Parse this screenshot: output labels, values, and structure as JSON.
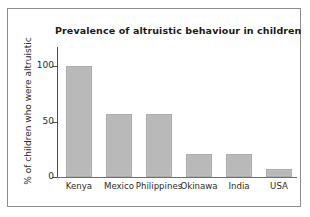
{
  "figure": {
    "title": "Prevalence of altruistic behaviour in children",
    "frame_color": "#8d8d8d",
    "background": "#ffffff",
    "bar_color": "#b9b9b9",
    "axis_color": "#4d4d4d"
  },
  "chart_data": {
    "type": "bar",
    "title": "Prevalence of altruistic behaviour in children",
    "xlabel": "",
    "ylabel": "% of children who were altruistic",
    "categories": [
      "Kenya",
      "Mexico",
      "Philippines",
      "Okinawa",
      "India",
      "USA"
    ],
    "values": [
      100,
      57,
      57,
      21,
      21,
      7
    ],
    "ylim": [
      0,
      110
    ],
    "yticks": [
      0,
      50,
      100
    ],
    "ytick_labels": [
      "0",
      "50",
      "100"
    ],
    "grid": false,
    "legend": null,
    "series": [
      {
        "name": "% of children who were altruistic",
        "values": [
          100,
          57,
          57,
          21,
          21,
          7
        ]
      }
    ]
  }
}
